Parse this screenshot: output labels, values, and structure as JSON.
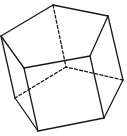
{
  "diagram": {
    "type": "line-drawing",
    "stroke_color": "#1a1a1a",
    "background": "#ffffff",
    "vertices": {
      "A": [
        53,
        5
      ],
      "B": [
        108,
        16
      ],
      "C": [
        90,
        56
      ],
      "D": [
        24,
        68
      ],
      "E": [
        1,
        36
      ],
      "F": [
        66,
        67
      ],
      "G": [
        123,
        80
      ],
      "H": [
        104,
        118
      ],
      "I": [
        38,
        131
      ],
      "J": [
        15,
        98
      ]
    },
    "edges": [
      {
        "from": "A",
        "to": "B",
        "style": "solid"
      },
      {
        "from": "B",
        "to": "C",
        "style": "solid"
      },
      {
        "from": "C",
        "to": "D",
        "style": "solid"
      },
      {
        "from": "D",
        "to": "E",
        "style": "solid"
      },
      {
        "from": "E",
        "to": "A",
        "style": "solid"
      },
      {
        "from": "E",
        "to": "J",
        "style": "solid"
      },
      {
        "from": "D",
        "to": "I",
        "style": "solid"
      },
      {
        "from": "C",
        "to": "H",
        "style": "solid"
      },
      {
        "from": "B",
        "to": "G",
        "style": "solid"
      },
      {
        "from": "A",
        "to": "F",
        "style": "dashed"
      },
      {
        "from": "J",
        "to": "I",
        "style": "solid"
      },
      {
        "from": "I",
        "to": "H",
        "style": "solid"
      },
      {
        "from": "H",
        "to": "G",
        "style": "solid"
      },
      {
        "from": "G",
        "to": "F",
        "style": "dashed"
      },
      {
        "from": "F",
        "to": "J",
        "style": "dashed"
      }
    ]
  }
}
